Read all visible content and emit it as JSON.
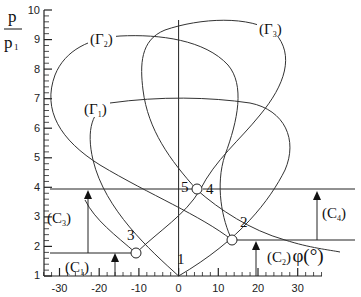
{
  "axes": {
    "y_label_num": "p",
    "y_label_den": "p",
    "y_label_den_sub": "1",
    "x_label": "φ(°)",
    "y_ticks": [
      "1",
      "2",
      "3",
      "4",
      "5",
      "6",
      "7",
      "8",
      "9",
      "10"
    ],
    "x_ticks": [
      "-30",
      "-20",
      "-10",
      "0",
      "10",
      "20",
      "30"
    ]
  },
  "curves": {
    "gamma1": {
      "label": "(Γ",
      "sub": "1",
      "close": ")"
    },
    "gamma2": {
      "label": "(Γ",
      "sub": "2",
      "close": ")"
    },
    "gamma3": {
      "label": "(Γ",
      "sub": "3",
      "close": ")"
    }
  },
  "shocks": {
    "c1": {
      "label": "(C",
      "sub": "1",
      "close": ")"
    },
    "c2": {
      "label": "(C",
      "sub": "2",
      "close": ")"
    },
    "c3": {
      "label": "(C",
      "sub": "3",
      "close": ")"
    },
    "c4": {
      "label": "(C",
      "sub": "4",
      "close": ")"
    }
  },
  "points": {
    "p1": "1",
    "p2": "2",
    "p3": "3",
    "p4": "4",
    "p5": "5"
  },
  "chart_data": {
    "type": "line",
    "title": "",
    "xlabel": "φ (°)",
    "ylabel": "p / p1",
    "xlim": [
      -36,
      36
    ],
    "ylim": [
      1,
      10
    ],
    "series": [
      {
        "name": "(Γ1)",
        "description": "shock polar from state 1 (origin at φ=0, p/p1=1), apex ~7.0"
      },
      {
        "name": "(Γ2)",
        "description": "shock polar from state 2 (φ≈+14, p/p1≈2.3), apex ~9.0"
      },
      {
        "name": "(Γ3)",
        "description": "shock polar from state 3 (φ≈-11, p/p1≈1.85), apex ~9.4"
      }
    ],
    "points": [
      {
        "id": "1",
        "phi": 0,
        "p_ratio": 1.0
      },
      {
        "id": "2",
        "phi": 14,
        "p_ratio": 2.3
      },
      {
        "id": "3",
        "phi": -11,
        "p_ratio": 1.85
      },
      {
        "id": "4",
        "phi": 5,
        "p_ratio": 4.0
      },
      {
        "id": "5",
        "phi": 5,
        "p_ratio": 4.0
      }
    ],
    "annotations": [
      "(C1)",
      "(C2)",
      "(C3)",
      "(C4)"
    ]
  }
}
